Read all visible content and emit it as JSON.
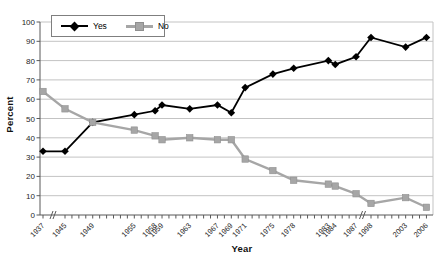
{
  "figure": {
    "y_axis_title": "Percent",
    "x_axis_title": "Year"
  },
  "legend": {
    "items": [
      {
        "label": "Yes"
      },
      {
        "label": "No"
      }
    ]
  },
  "chart_data": {
    "type": "line",
    "title": "",
    "xlabel": "Year",
    "ylabel": "Percent",
    "ylim": [
      0,
      100
    ],
    "y_ticks": [
      0,
      10,
      20,
      30,
      40,
      50,
      60,
      70,
      80,
      90,
      100
    ],
    "grid": true,
    "legend_position": "top-left-inside",
    "x_axis_breaks": [
      [
        1937,
        1945
      ],
      [
        1987,
        1998
      ]
    ],
    "x": [
      1937,
      1945,
      1949,
      1955,
      1958,
      1959,
      1963,
      1967,
      1969,
      1971,
      1975,
      1978,
      1983,
      1984,
      1987,
      1998,
      2003,
      2006
    ],
    "series": [
      {
        "name": "Yes",
        "marker": "diamond",
        "color": "#000000",
        "values": [
          33,
          33,
          48,
          52,
          54,
          57,
          55,
          57,
          53,
          66,
          73,
          76,
          80,
          78,
          82,
          92,
          87,
          92
        ]
      },
      {
        "name": "No",
        "marker": "square",
        "color": "#a6a6a6",
        "values": [
          64,
          55,
          48,
          44,
          41,
          39,
          40,
          39,
          39,
          29,
          23,
          18,
          16,
          15,
          11,
          6,
          9,
          4
        ]
      }
    ],
    "colors": {
      "grid": "#c3c3c3",
      "axis": "#595959",
      "tick_label": "#262626"
    }
  }
}
